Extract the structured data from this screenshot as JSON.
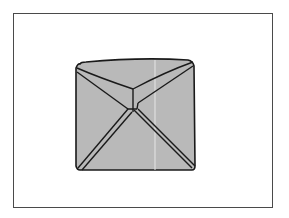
{
  "figure": {
    "colors": {
      "fill": "#b9b9b9",
      "stroke": "#1a1a1a",
      "frame": "#4a4a4a",
      "background": "#ffffff"
    }
  }
}
